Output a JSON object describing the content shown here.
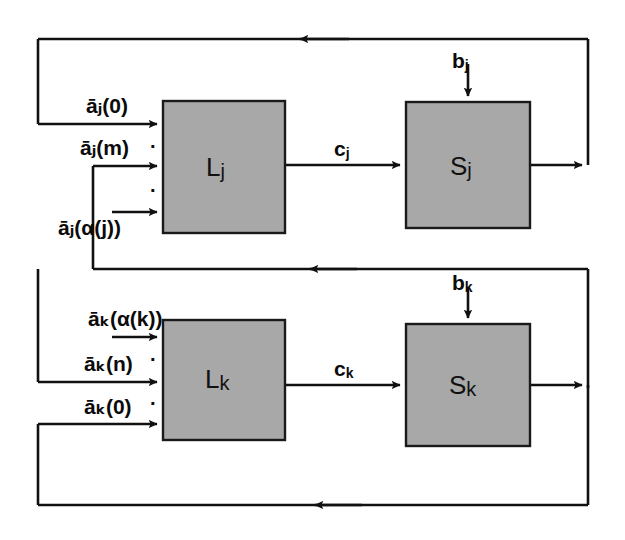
{
  "figure": {
    "type": "block-diagram",
    "title": "",
    "background": "#ffffff",
    "block_fill": "#a8a8a8",
    "block_stroke": "#1a1a1a",
    "line_color": "#111111"
  },
  "blocks": [
    {
      "id": "Lj",
      "label_main": "L",
      "label_sub": "j",
      "x": 163,
      "y": 101,
      "w": 122,
      "h": 132
    },
    {
      "id": "Sj",
      "label_main": "S",
      "label_sub": "j",
      "x": 406,
      "y": 102,
      "w": 124,
      "h": 126
    },
    {
      "id": "Lk",
      "label_main": "L",
      "label_sub": "k",
      "x": 163,
      "y": 320,
      "w": 122,
      "h": 120
    },
    {
      "id": "Sk",
      "label_main": "S",
      "label_sub": "k",
      "x": 406,
      "y": 324,
      "w": 124,
      "h": 122
    }
  ],
  "inputs_top": [
    {
      "base": "a",
      "bar": true,
      "sub": "j",
      "arg": "(0)",
      "text": "āⱼ(0)",
      "y": 124
    },
    {
      "base": "a",
      "bar": true,
      "sub": "j",
      "arg": "(m)",
      "text": "āⱼ(m)",
      "y": 166
    },
    {
      "base": "a",
      "bar": true,
      "sub": "j",
      "arg": "(α(j))",
      "text": "āⱼ(α(j))",
      "y": 212
    }
  ],
  "inputs_bottom": [
    {
      "base": "a",
      "bar": true,
      "sub": "k",
      "arg": "(α(k))",
      "text": "āₖ(α(k))",
      "y": 337
    },
    {
      "base": "a",
      "bar": true,
      "sub": "k",
      "arg": "(n)",
      "text": "āₖ(n)",
      "y": 382
    },
    {
      "base": "a",
      "bar": true,
      "sub": "k",
      "arg": "(0)",
      "text": "āₖ(0)",
      "y": 424
    }
  ],
  "signals": {
    "b_j": {
      "main": "b",
      "sub": "j",
      "x": 452,
      "y": 63
    },
    "b_k": {
      "main": "b",
      "sub": "k",
      "x": 452,
      "y": 285
    },
    "c_j": {
      "main": "c",
      "sub": "j",
      "x": 334,
      "y": 148
    },
    "c_k": {
      "main": "c",
      "sub": "k",
      "x": 334,
      "y": 368
    }
  },
  "ellipses": {
    "top": [
      {
        "x": 152,
        "y": 143
      },
      {
        "x": 152,
        "y": 186
      }
    ],
    "bottom": [
      {
        "x": 152,
        "y": 356
      },
      {
        "x": 152,
        "y": 400
      }
    ]
  },
  "geometry": {
    "frame_left": 38,
    "frame_top": 39,
    "frame_right": 588,
    "frame_bottom": 505,
    "mid_feedback_y": 269,
    "inner_left": 93,
    "arrow_top_x": 347,
    "arrow_mid_x": 355,
    "arrow_bottom_x": 360
  }
}
